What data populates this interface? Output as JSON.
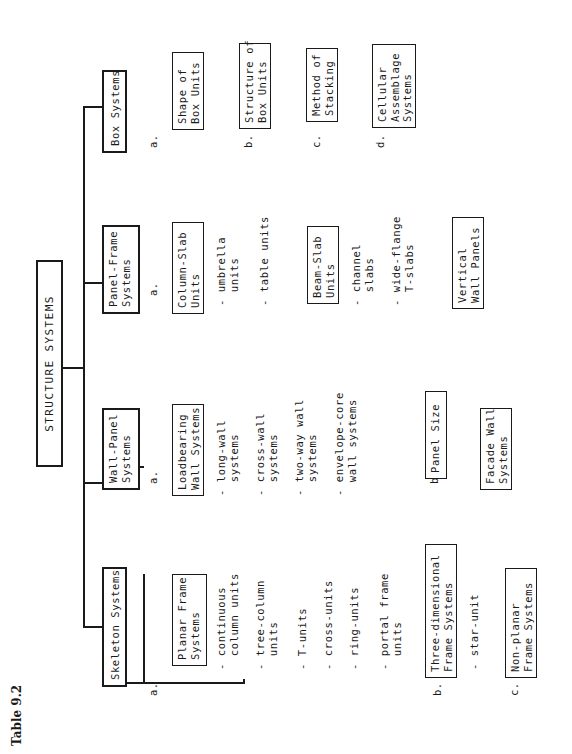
{
  "caption": "Table 9.2",
  "title": "STRUCTURE SYSTEMS",
  "categories": [
    {
      "label": "Skeleton Systems",
      "children": [
        {
          "marker": "a.",
          "label": "Planar Frame\nSystems",
          "items": [
            "- continuous\n  column units",
            "- tree-column\n  units",
            "- T-units",
            "- cross-units",
            "- ring-units",
            "- portal frame\n  units"
          ]
        },
        {
          "marker": "b.",
          "label": "Three-dimensional\nFrame Systems",
          "items": [
            "- star-unit"
          ]
        },
        {
          "marker": "c.",
          "label": "Non-planar\nFrame Systems",
          "items": []
        }
      ]
    },
    {
      "label": "Wall-Panel\nSystems",
      "children": [
        {
          "marker": "a.",
          "label": "Loadbearing\nWall Systems",
          "items": [
            "- long-wall\n  systems",
            "- cross-wall\n  systems",
            "- two-way wall\n  systems",
            "- envelope-core\n  wall systems"
          ]
        },
        {
          "marker": "b.",
          "label": "Panel Size",
          "items": []
        },
        {
          "marker": "c.",
          "label": "Facade Wall\nSystems",
          "items": []
        }
      ]
    },
    {
      "label": "Panel-Frame\nSystems",
      "children": [
        {
          "marker": "a.",
          "label": "Column-Slab\nUnits",
          "items": [
            "- umbrella\n  units",
            "- table units"
          ]
        },
        {
          "marker": "b.",
          "label": "Beam-Slab\nUnits",
          "items": [
            "- channel\n  slabs",
            "- wide-flange\n  T-slabs"
          ]
        },
        {
          "marker": "c.",
          "label": "Vertical\nWall Panels",
          "items": []
        }
      ]
    },
    {
      "label": "Box Systems",
      "children": [
        {
          "marker": "a.",
          "label": "Shape of\nBox Units",
          "items": []
        },
        {
          "marker": "b.",
          "label": "Structure of\nBox Units",
          "items": []
        },
        {
          "marker": "c.",
          "label": "Method of\nStacking",
          "items": []
        },
        {
          "marker": "d.",
          "label": "Cellular\nAssemblage\nSystems",
          "items": []
        }
      ]
    }
  ]
}
